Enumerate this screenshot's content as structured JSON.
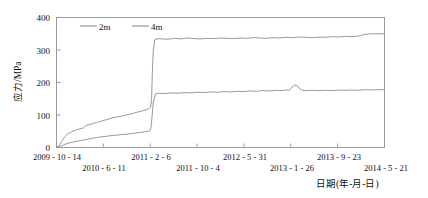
{
  "chart_data": {
    "type": "line",
    "title": "",
    "xlabel": "日期(年-月-日)",
    "ylabel": "应力/MPa",
    "ylim": [
      0,
      400
    ],
    "yticks": [
      0,
      100,
      200,
      300,
      400
    ],
    "ytick_labels": [
      "0",
      "100",
      "200",
      "300",
      "400"
    ],
    "grid": false,
    "legend_position": "top-left-inside",
    "xtick_labels": [
      "2009 - 10 - 14",
      "2010 - 6 - 11",
      "2011 - 2 - 6",
      "2011 - 10 - 4",
      "2012 - 5 - 31",
      "2013 - 1 - 26",
      "2013 - 9 - 23",
      "2014 - 5 - 21"
    ],
    "xtick_positions_frac": [
      0.0,
      0.1429,
      0.2857,
      0.4286,
      0.5714,
      0.7143,
      0.8571,
      1.0
    ],
    "series": [
      {
        "name": "2m",
        "color": "#8c8c8c",
        "x": [
          0.0,
          0.01,
          0.018,
          0.026,
          0.034,
          0.042,
          0.05,
          0.058,
          0.066,
          0.074,
          0.082,
          0.09,
          0.098,
          0.106,
          0.114,
          0.122,
          0.13,
          0.14,
          0.15,
          0.16,
          0.17,
          0.18,
          0.19,
          0.2,
          0.21,
          0.22,
          0.23,
          0.24,
          0.25,
          0.26,
          0.27,
          0.278,
          0.283,
          0.287,
          0.29,
          0.292,
          0.295,
          0.3,
          0.31,
          0.325,
          0.34,
          0.36,
          0.38,
          0.4,
          0.42,
          0.44,
          0.46,
          0.48,
          0.5,
          0.52,
          0.54,
          0.56,
          0.58,
          0.6,
          0.62,
          0.64,
          0.66,
          0.68,
          0.7,
          0.72,
          0.74,
          0.76,
          0.78,
          0.8,
          0.82,
          0.84,
          0.86,
          0.88,
          0.9,
          0.92,
          0.93,
          0.94,
          0.95,
          0.96,
          0.98,
          1.0
        ],
        "y": [
          0,
          8,
          22,
          34,
          42,
          46,
          50,
          53,
          56,
          58,
          60,
          68,
          70,
          72,
          75,
          77,
          79,
          82,
          85,
          88,
          91,
          93,
          95,
          97,
          99,
          101,
          104,
          107,
          110,
          112,
          115,
          118,
          120,
          124,
          150,
          225,
          300,
          332,
          335,
          334,
          333,
          336,
          334,
          337,
          335,
          334,
          336,
          335,
          337,
          336,
          335,
          337,
          336,
          338,
          337,
          336,
          338,
          337,
          339,
          338,
          340,
          339,
          338,
          340,
          339,
          341,
          340,
          342,
          341,
          343,
          345,
          348,
          349,
          350,
          350,
          350
        ]
      },
      {
        "name": "4m",
        "color": "#8c8c8c",
        "x": [
          0.0,
          0.012,
          0.022,
          0.032,
          0.042,
          0.052,
          0.062,
          0.072,
          0.082,
          0.092,
          0.102,
          0.112,
          0.125,
          0.14,
          0.155,
          0.17,
          0.185,
          0.2,
          0.215,
          0.23,
          0.245,
          0.26,
          0.272,
          0.28,
          0.285,
          0.288,
          0.291,
          0.295,
          0.302,
          0.315,
          0.33,
          0.35,
          0.37,
          0.39,
          0.41,
          0.43,
          0.45,
          0.47,
          0.49,
          0.51,
          0.53,
          0.55,
          0.57,
          0.59,
          0.61,
          0.63,
          0.65,
          0.67,
          0.69,
          0.7,
          0.71,
          0.718,
          0.726,
          0.734,
          0.742,
          0.75,
          0.76,
          0.78,
          0.8,
          0.82,
          0.84,
          0.86,
          0.88,
          0.9,
          0.92,
          0.94,
          0.96,
          0.98,
          1.0
        ],
        "y": [
          0,
          3,
          8,
          12,
          15,
          17,
          19,
          21,
          23,
          25,
          27,
          29,
          31,
          33,
          35,
          37,
          38,
          40,
          41,
          43,
          45,
          47,
          49,
          50,
          52,
          60,
          90,
          140,
          165,
          167,
          166,
          168,
          167,
          169,
          168,
          170,
          169,
          171,
          170,
          172,
          171,
          173,
          172,
          174,
          173,
          175,
          174,
          176,
          175,
          177,
          176,
          186,
          192,
          190,
          180,
          176,
          175,
          176,
          175,
          176,
          175,
          177,
          176,
          177,
          176,
          178,
          177,
          178,
          178
        ]
      }
    ]
  },
  "legend": {
    "entries": [
      {
        "label": "2m",
        "color": "#8c8c8c"
      },
      {
        "label": "4m",
        "color": "#8c8c8c"
      }
    ]
  },
  "axes": {
    "y_title": "应力/MPa",
    "x_title": "日期(年-月-日)",
    "y_tick_0": "0",
    "y_tick_1": "100",
    "y_tick_2": "200",
    "y_tick_3": "300",
    "y_tick_4": "400",
    "x_tick_0": "2009 - 10 - 14",
    "x_tick_1": "2010 - 6 - 11",
    "x_tick_2": "2011 - 2 - 6",
    "x_tick_3": "2011 - 10 - 4",
    "x_tick_4": "2012 - 5 - 31",
    "x_tick_5": "2013 - 1 - 26",
    "x_tick_6": "2013 - 9 - 23",
    "x_tick_7": "2014 - 5 - 21"
  }
}
